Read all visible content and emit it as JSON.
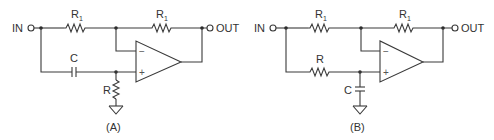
{
  "figure": {
    "circuits": [
      {
        "id": "A",
        "caption": "(A)",
        "input_label": "IN",
        "output_label": "OUT",
        "feedback_resistor": {
          "label": "R",
          "subscript": "1"
        },
        "input_resistor": {
          "label": "R",
          "subscript": "1"
        },
        "noninverting_series": {
          "type": "capacitor",
          "label": "C"
        },
        "noninverting_shunt": {
          "type": "resistor",
          "label": "R"
        },
        "opamp_minus": "−",
        "opamp_plus": "+"
      },
      {
        "id": "B",
        "caption": "(B)",
        "input_label": "IN",
        "output_label": "OUT",
        "feedback_resistor": {
          "label": "R",
          "subscript": "1"
        },
        "input_resistor": {
          "label": "R",
          "subscript": "1"
        },
        "noninverting_series": {
          "type": "resistor",
          "label": "R"
        },
        "noninverting_shunt": {
          "type": "capacitor",
          "label": "C"
        },
        "opamp_minus": "−",
        "opamp_plus": "+"
      }
    ],
    "colors": {
      "line": "#3a3a3a",
      "text": "#333333",
      "background": "#ffffff"
    }
  }
}
